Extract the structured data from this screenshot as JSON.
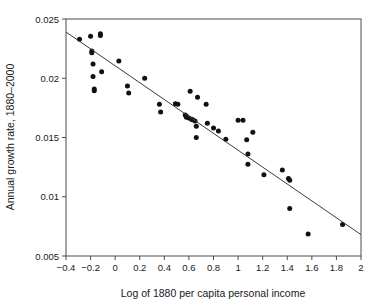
{
  "chart_data": {
    "type": "scatter",
    "title": "",
    "xlabel": "Log of 1880 per capita personal income",
    "ylabel": "Annual growth rate, 1880–2000",
    "xlim": [
      -0.4,
      2
    ],
    "ylim": [
      0.005,
      0.025
    ],
    "grid": false,
    "legend": null,
    "xticks": [
      "-0.4",
      "-0.2",
      "0",
      "0.2",
      "0.4",
      "0.6",
      "0.8",
      "1",
      "1.2",
      "1.4",
      "1.6",
      "1.8",
      "2"
    ],
    "xtick_values": [
      -0.4,
      -0.2,
      0,
      0.2,
      0.4,
      0.6,
      0.8,
      1,
      1.2,
      1.4,
      1.6,
      1.8,
      2
    ],
    "yticks": [
      "0.005",
      "0.01",
      "0.015",
      "0.02",
      "0.025"
    ],
    "ytick_values": [
      0.005,
      0.01,
      0.015,
      0.02,
      0.025
    ],
    "marker": "filled-circle",
    "marker_color": "#111111",
    "marker_radius": 2.5,
    "series": [
      {
        "name": "states",
        "points": [
          [
            -0.29,
            0.0233
          ],
          [
            -0.2,
            0.02355
          ],
          [
            -0.19,
            0.0223
          ],
          [
            -0.19,
            0.02215
          ],
          [
            -0.18,
            0.0212
          ],
          [
            -0.18,
            0.02015
          ],
          [
            -0.17,
            0.0191
          ],
          [
            -0.17,
            0.01895
          ],
          [
            -0.12,
            0.02375
          ],
          [
            -0.12,
            0.0236
          ],
          [
            -0.11,
            0.02055
          ],
          [
            0.03,
            0.02145
          ],
          [
            0.1,
            0.01935
          ],
          [
            0.11,
            0.01875
          ],
          [
            0.24,
            0.02
          ],
          [
            0.36,
            0.0178
          ],
          [
            0.37,
            0.01715
          ],
          [
            0.49,
            0.01785
          ],
          [
            0.51,
            0.0178
          ],
          [
            0.57,
            0.0169
          ],
          [
            0.58,
            0.0168
          ],
          [
            0.58,
            0.0167
          ],
          [
            0.6,
            0.01665
          ],
          [
            0.61,
            0.0189
          ],
          [
            0.62,
            0.01655
          ],
          [
            0.63,
            0.0165
          ],
          [
            0.65,
            0.0164
          ],
          [
            0.66,
            0.01595
          ],
          [
            0.66,
            0.015
          ],
          [
            0.67,
            0.0184
          ],
          [
            0.74,
            0.0178
          ],
          [
            0.75,
            0.0162
          ],
          [
            0.8,
            0.0158
          ],
          [
            0.84,
            0.01555
          ],
          [
            0.9,
            0.01485
          ],
          [
            1.0,
            0.01645
          ],
          [
            1.04,
            0.01645
          ],
          [
            1.07,
            0.0148
          ],
          [
            1.08,
            0.0136
          ],
          [
            1.08,
            0.01275
          ],
          [
            1.12,
            0.01545
          ],
          [
            1.21,
            0.01185
          ],
          [
            1.36,
            0.01225
          ],
          [
            1.41,
            0.01155
          ],
          [
            1.42,
            0.0114
          ],
          [
            1.42,
            0.009
          ],
          [
            1.57,
            0.00685
          ],
          [
            1.85,
            0.00765
          ]
        ]
      }
    ],
    "fit_line": {
      "name": "regression-line",
      "x_start": -0.4,
      "y_start": 0.0239,
      "x_end": 2.0,
      "y_end": 0.0068,
      "color": "#3a3a3a"
    }
  }
}
